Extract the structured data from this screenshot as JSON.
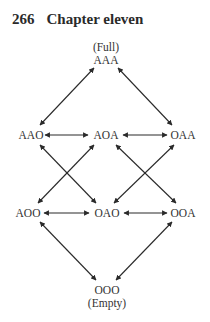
{
  "header": {
    "page_number": "266",
    "chapter_title": "Chapter eleven"
  },
  "diagram": {
    "top": {
      "caption": "(Full)",
      "label": "AAA"
    },
    "row2": [
      {
        "label": "AAO"
      },
      {
        "label": "AOA"
      },
      {
        "label": "OAA"
      }
    ],
    "row3": [
      {
        "label": "AOO"
      },
      {
        "label": "OAO"
      },
      {
        "label": "OOA"
      }
    ],
    "bottom": {
      "label": "OOO",
      "caption": "(Empty)"
    },
    "edges": [
      [
        "AAA",
        "AAO"
      ],
      [
        "AAA",
        "OAA"
      ],
      [
        "AAO",
        "AOA"
      ],
      [
        "AOA",
        "OAA"
      ],
      [
        "AAO",
        "OAO"
      ],
      [
        "AOA",
        "AOO"
      ],
      [
        "AOA",
        "OOA"
      ],
      [
        "OAA",
        "OAO"
      ],
      [
        "AOO",
        "OAO"
      ],
      [
        "OAO",
        "OOA"
      ],
      [
        "AOO",
        "OOO"
      ],
      [
        "OOA",
        "OOO"
      ]
    ],
    "edge_style": "bidirectional-arrow",
    "line_color": "#2a2a2a"
  }
}
